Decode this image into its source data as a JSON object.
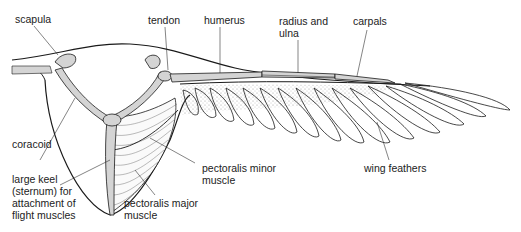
{
  "diagram": {
    "colors": {
      "bone": "#d4d4d4",
      "outline": "#1a1a1a",
      "stipple": "#9a9a9a",
      "background": "#ffffff"
    },
    "labels": {
      "scapula": {
        "lines": [
          "scapula"
        ]
      },
      "tendon": {
        "lines": [
          "tendon"
        ]
      },
      "humerus": {
        "lines": [
          "humerus"
        ]
      },
      "radius_ulna": {
        "lines": [
          "radius and",
          "ulna"
        ]
      },
      "carpals": {
        "lines": [
          "carpals"
        ]
      },
      "coracoid": {
        "lines": [
          "coracoid"
        ]
      },
      "keel": {
        "lines": [
          "large keel",
          "(sternum) for",
          "attachment of",
          "flight muscles"
        ]
      },
      "pect_minor": {
        "lines": [
          "pectoralis minor",
          "muscle"
        ]
      },
      "pect_major": {
        "lines": [
          "pectoralis major",
          "muscle"
        ]
      },
      "wing_feathers": {
        "lines": [
          "wing feathers"
        ]
      }
    }
  }
}
